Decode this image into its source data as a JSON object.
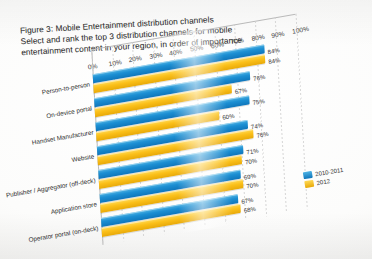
{
  "figure": {
    "title_lines": [
      "Figure 3: Mobile Entertainment distribution channels",
      "Select and rank the top 3 distribution channels for mobile",
      "entertainment content in your region, in order of importance"
    ]
  },
  "legend": {
    "position": "right",
    "entries": [
      {
        "label": "2010-2011",
        "color": "#1c8fd3",
        "icon": "legend-swatch-blue"
      },
      {
        "label": "2012",
        "color": "#fbc01a",
        "icon": "legend-swatch-yellow"
      }
    ]
  },
  "axis": {
    "x_ticks": [
      "0%",
      "10%",
      "20%",
      "30%",
      "40%",
      "50%",
      "60%",
      "70%",
      "80%",
      "90%",
      "100%"
    ]
  },
  "chart_data": {
    "type": "bar",
    "orientation": "horizontal",
    "title": "Figure 3: Mobile Entertainment distribution channels",
    "subtitle": "Select and rank the top 3 distribution channels for mobile entertainment content in your region, in order of importance",
    "xlabel": "",
    "ylabel": "",
    "xlim": [
      0,
      100
    ],
    "x_ticks": [
      0,
      10,
      20,
      30,
      40,
      50,
      60,
      70,
      80,
      90,
      100
    ],
    "grid": true,
    "legend_position": "right",
    "categories": [
      "Person-to-person",
      "On-device portal",
      "Handset Manufacturer",
      "Website",
      "Publisher / Aggregator (off-deck)",
      "Application store",
      "Operator portal (on-deck)"
    ],
    "series": [
      {
        "name": "2010-2011",
        "color": "#1c8fd3",
        "values": [
          84,
          76,
          75,
          74,
          71,
          69,
          67
        ],
        "value_labels": [
          "84%",
          "76%",
          "75%",
          "74%",
          "71%",
          "69%",
          "67%"
        ]
      },
      {
        "name": "2012",
        "color": "#fbc01a",
        "values": [
          84,
          67,
          60,
          76,
          70,
          70,
          68
        ],
        "value_labels": [
          "84%",
          "67%",
          "60%",
          "76%",
          "70%",
          "70%",
          "68%"
        ]
      }
    ]
  }
}
